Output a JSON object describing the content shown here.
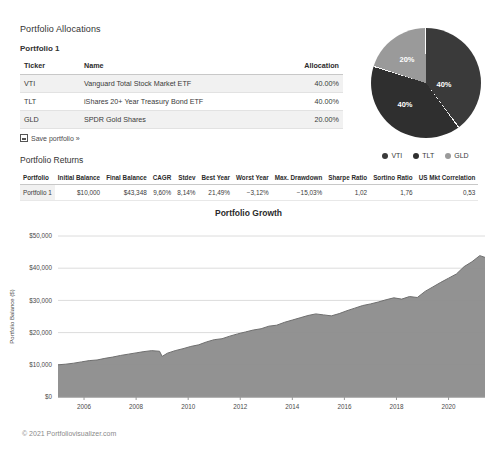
{
  "allocations": {
    "section_title": "Portfolio Allocations",
    "portfolio_label": "Portfolio 1",
    "columns": [
      "Ticker",
      "Name",
      "Allocation"
    ],
    "rows": [
      {
        "ticker": "VTI",
        "name": "Vanguard Total Stock Market ETF",
        "allocation": "40.00%"
      },
      {
        "ticker": "TLT",
        "name": "iShares 20+ Year Treasury Bond ETF",
        "allocation": "40.00%"
      },
      {
        "ticker": "GLD",
        "name": "SPDR Gold Shares",
        "allocation": "20.00%"
      }
    ],
    "save_link": "Save portfolio »"
  },
  "pie": {
    "labels": [
      "40%",
      "40%",
      "20%"
    ],
    "legend": [
      {
        "label": "VTI",
        "color": "#3a3a3a"
      },
      {
        "label": "TLT",
        "color": "#2f2f2f"
      },
      {
        "label": "GLD",
        "color": "#9a9a9a"
      }
    ],
    "chart_data": {
      "type": "pie",
      "categories": [
        "VTI",
        "TLT",
        "GLD"
      ],
      "values": [
        40,
        40,
        20
      ],
      "title": "",
      "legend_position": "bottom"
    }
  },
  "returns": {
    "section_title": "Portfolio Returns",
    "columns": [
      "Portfolio",
      "Initial Balance",
      "Final Balance",
      "CAGR",
      "Stdev",
      "Best Year",
      "Worst Year",
      "Max. Drawdown",
      "Sharpe Ratio",
      "Sortino Ratio",
      "US Mkt Correlation"
    ],
    "rows": [
      {
        "portfolio": "Portfolio 1",
        "initial_balance": "$10,000",
        "final_balance": "$43,348",
        "cagr": "9,60%",
        "stdev": "8,14%",
        "best_year": "21,49%",
        "worst_year": "−3,12%",
        "max_drawdown": "−15,03%",
        "sharpe_ratio": "1,02",
        "sortino_ratio": "1,76",
        "us_mkt_correlation": "0,53"
      }
    ]
  },
  "growth": {
    "title": "Portfolio Growth",
    "chart_data": {
      "type": "area",
      "title": "Portfolio Growth",
      "xlabel": "",
      "ylabel": "Portfolio Balance ($)",
      "ylim": [
        0,
        50000
      ],
      "ytick_labels": [
        "$0",
        "$10,000",
        "$20,000",
        "$30,000",
        "$40,000",
        "$50,000"
      ],
      "ytick_values": [
        0,
        10000,
        20000,
        30000,
        40000,
        50000
      ],
      "xtick_labels": [
        "2006",
        "2008",
        "2010",
        "2012",
        "2014",
        "2016",
        "2018",
        "2020"
      ],
      "xtick_values": [
        2006,
        2008,
        2010,
        2012,
        2014,
        2016,
        2018,
        2020
      ],
      "xlim": [
        2005.0,
        2021.4
      ],
      "grid": true,
      "series_color": "#8c8c8c",
      "x": [
        2005.0,
        2005.3,
        2005.6,
        2005.9,
        2006.2,
        2006.5,
        2006.8,
        2007.1,
        2007.4,
        2007.7,
        2008.0,
        2008.3,
        2008.6,
        2008.9,
        2009.0,
        2009.2,
        2009.5,
        2009.8,
        2010.1,
        2010.4,
        2010.7,
        2011.0,
        2011.3,
        2011.6,
        2011.9,
        2012.2,
        2012.5,
        2012.8,
        2013.1,
        2013.4,
        2013.7,
        2014.0,
        2014.3,
        2014.6,
        2014.9,
        2015.2,
        2015.5,
        2015.8,
        2016.1,
        2016.4,
        2016.7,
        2017.0,
        2017.3,
        2017.6,
        2017.9,
        2018.2,
        2018.5,
        2018.8,
        2019.1,
        2019.4,
        2019.7,
        2020.0,
        2020.3,
        2020.6,
        2020.9,
        2021.2,
        2021.4
      ],
      "values": [
        10000,
        10200,
        10500,
        10900,
        11300,
        11500,
        12000,
        12400,
        12900,
        13300,
        13700,
        14100,
        14400,
        14200,
        12600,
        13600,
        14400,
        15000,
        15700,
        16200,
        17100,
        17800,
        18100,
        18900,
        19600,
        20200,
        20800,
        21200,
        22000,
        22300,
        23200,
        23900,
        24600,
        25300,
        25800,
        25500,
        25200,
        25900,
        26800,
        27600,
        28400,
        28900,
        29500,
        30200,
        30800,
        30400,
        31200,
        30900,
        32800,
        34200,
        35600,
        36900,
        38200,
        40500,
        42000,
        43900,
        43348
      ]
    }
  },
  "footer": {
    "copyright": "© 2021 Portfoliovisualizer.com"
  }
}
